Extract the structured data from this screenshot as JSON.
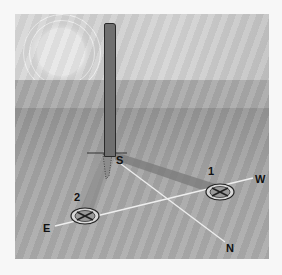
{
  "diagram": {
    "labels": {
      "marker_1": "1",
      "marker_2": "2",
      "east": "E",
      "west": "W",
      "south": "S",
      "north": "N"
    },
    "elements": [
      "sun",
      "stick",
      "shadow-1",
      "shadow-2",
      "marker-1",
      "marker-2",
      "east-west-line",
      "north-south-line"
    ]
  }
}
